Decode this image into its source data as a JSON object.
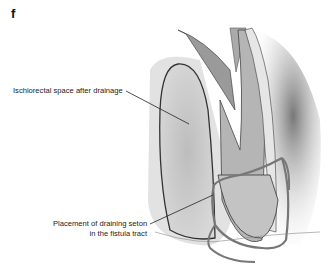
{
  "figure": {
    "panel_letter": "f",
    "labels": [
      {
        "id": "ischiorectal",
        "text": "Ischiorectal space after drainage"
      },
      {
        "id": "seton_line1",
        "text": "Placement of draining seton"
      },
      {
        "id": "seton_line2",
        "text": "in the fistula tract"
      }
    ]
  }
}
